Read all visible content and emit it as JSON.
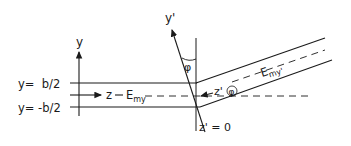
{
  "diagram": {
    "colors": {
      "line": "#1a1a1a",
      "background": "#ffffff"
    },
    "labels": {
      "y_axis": "y",
      "y_prime_axis": "y'",
      "top_boundary": "y=  b/2",
      "bottom_boundary": "y= -b/2",
      "z_axis": "z",
      "field_left_main": "E",
      "field_left_sub": "my",
      "field_right_main": "E",
      "field_right_sub": "my'",
      "angle_top": "φ",
      "z_prime": "z'",
      "angle_circled": "φ",
      "z_prime_zero": "z' = 0"
    }
  }
}
